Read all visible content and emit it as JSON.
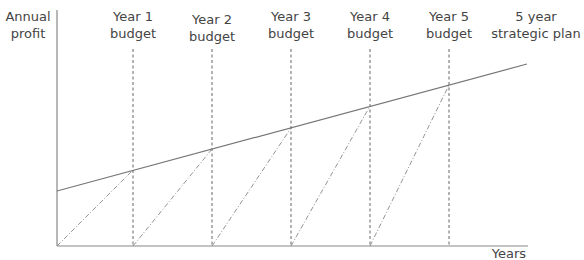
{
  "diagram": {
    "y_axis_label": [
      "Annual",
      "profit"
    ],
    "x_axis_label": "Years",
    "columns": [
      {
        "line1": "Year 1",
        "line2": "budget",
        "x": 133
      },
      {
        "line1": "Year 2",
        "line2": "budget",
        "x": 212
      },
      {
        "line1": "Year 3",
        "line2": "budget",
        "x": 291
      },
      {
        "line1": "Year 4",
        "line2": "budget",
        "x": 370
      },
      {
        "line1": "Year 5",
        "line2": "budget",
        "x": 449
      }
    ],
    "plan_label": [
      "5 year",
      "strategic plan"
    ],
    "colors": {
      "line": "#777777",
      "text": "#444444"
    }
  }
}
